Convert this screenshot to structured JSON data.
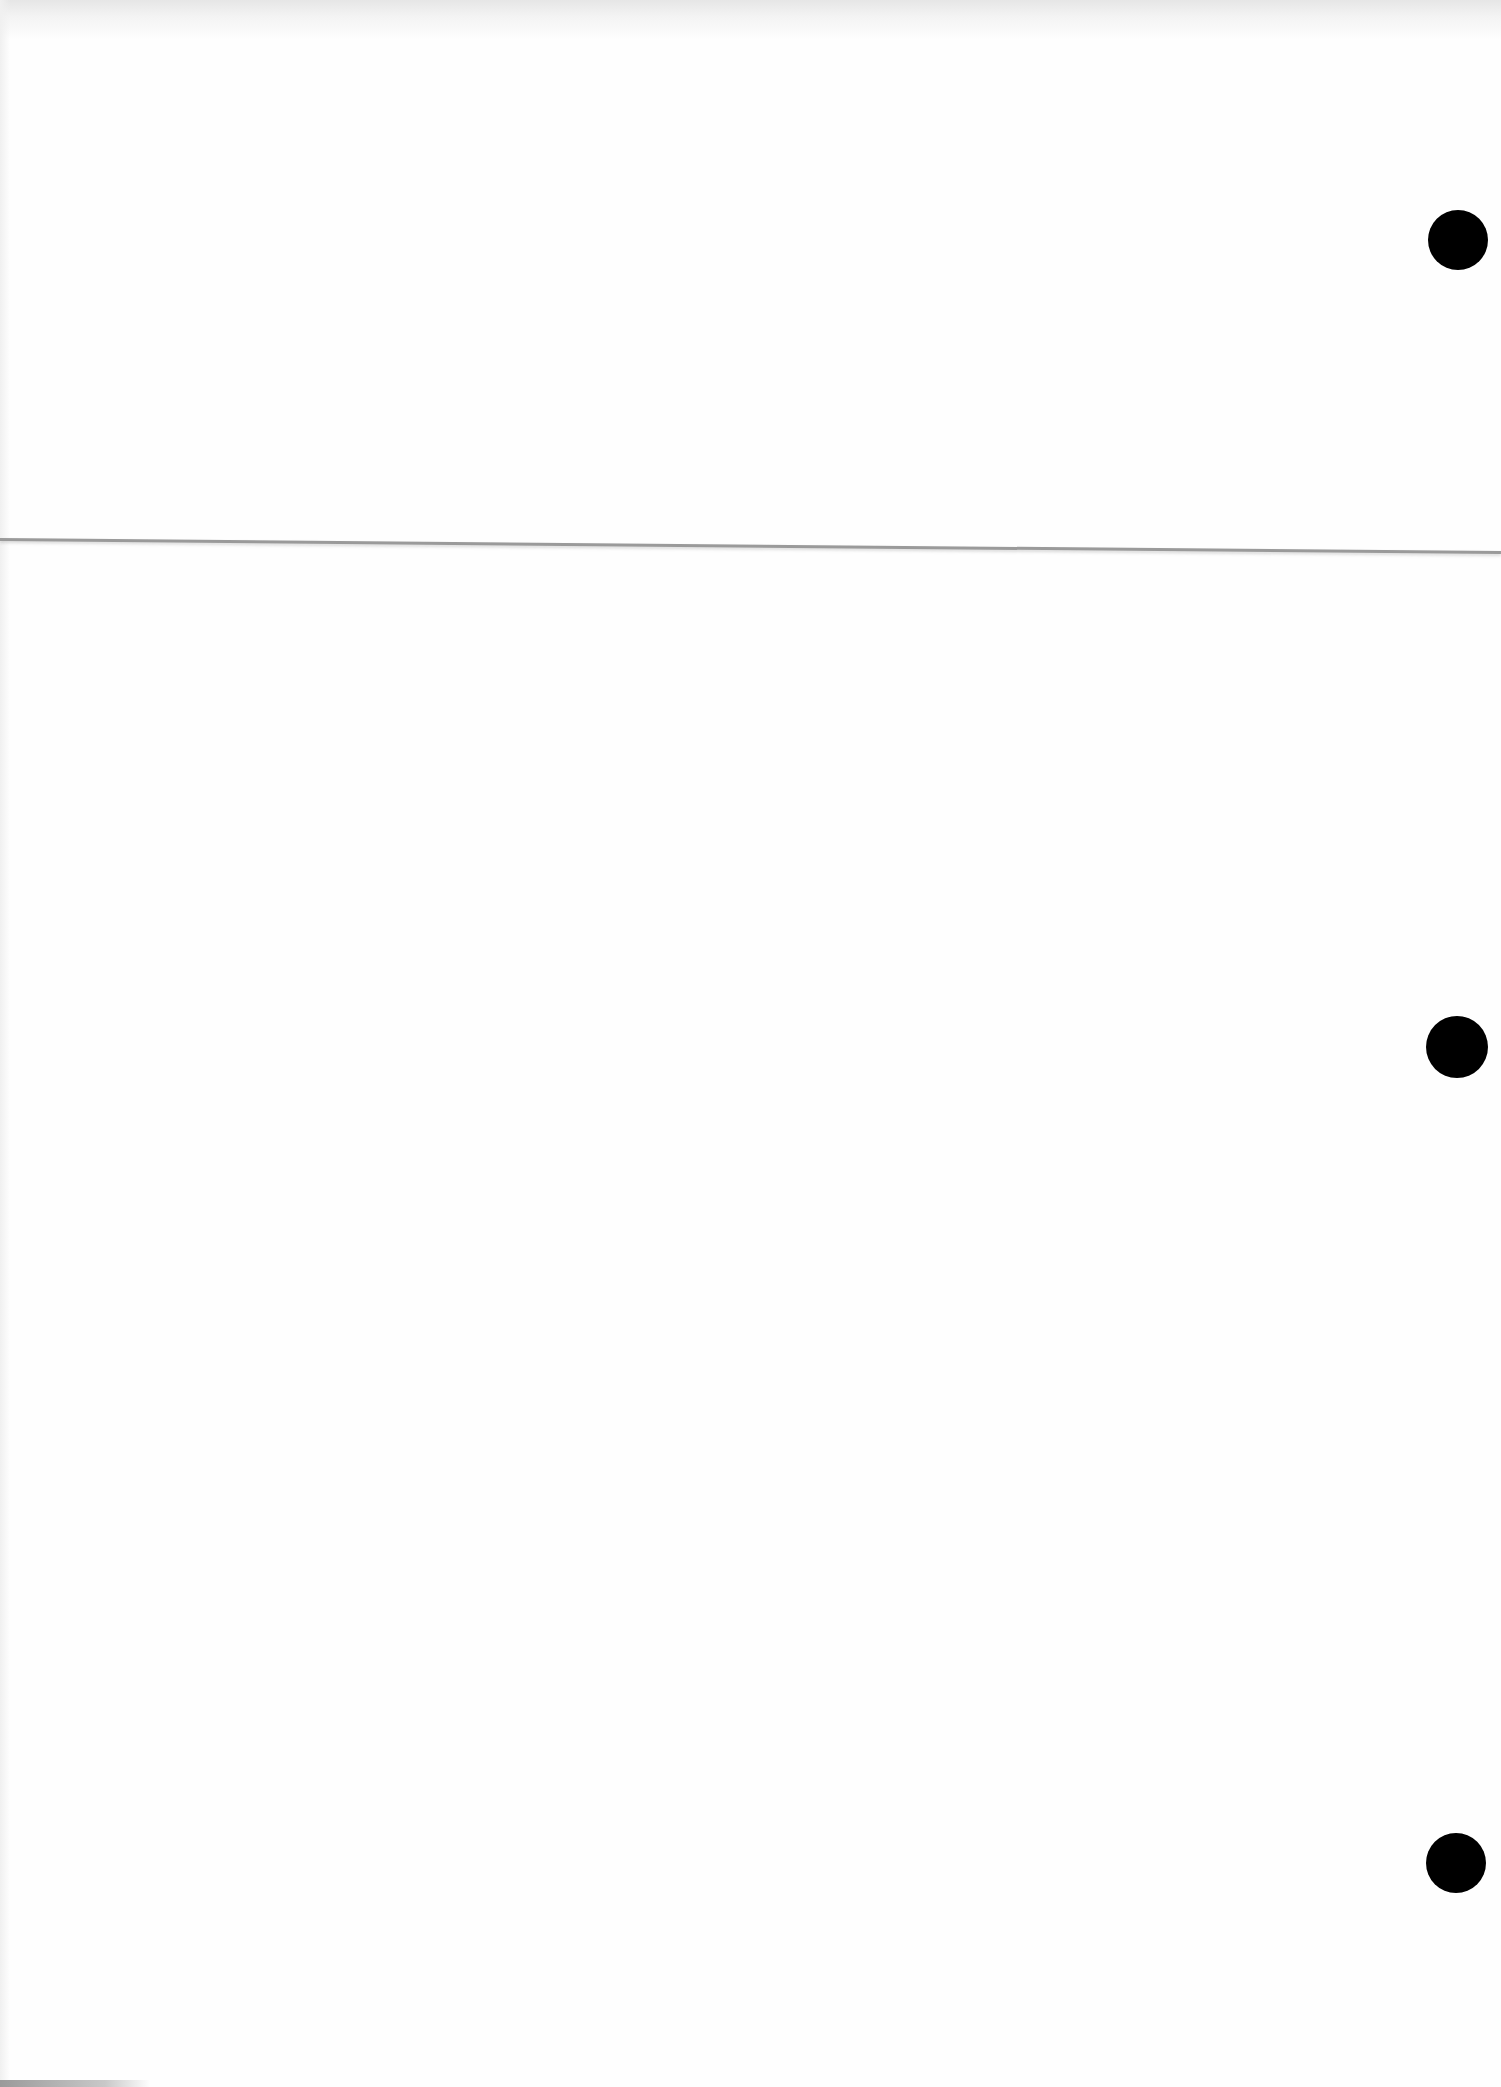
{
  "page": {
    "type": "blank scanned sheet",
    "background_color": "#fefefe",
    "text_content": ""
  },
  "fold_line": {
    "color": "#9a9a9a",
    "y_left": 538,
    "y_right": 553
  },
  "punch_holes": [
    {
      "cx": 1458,
      "cy": 240,
      "diameter": 60,
      "color": "#000000"
    },
    {
      "cx": 1457,
      "cy": 1047,
      "diameter": 62,
      "color": "#000000"
    },
    {
      "cx": 1456,
      "cy": 1863,
      "diameter": 60,
      "color": "#000000"
    }
  ]
}
